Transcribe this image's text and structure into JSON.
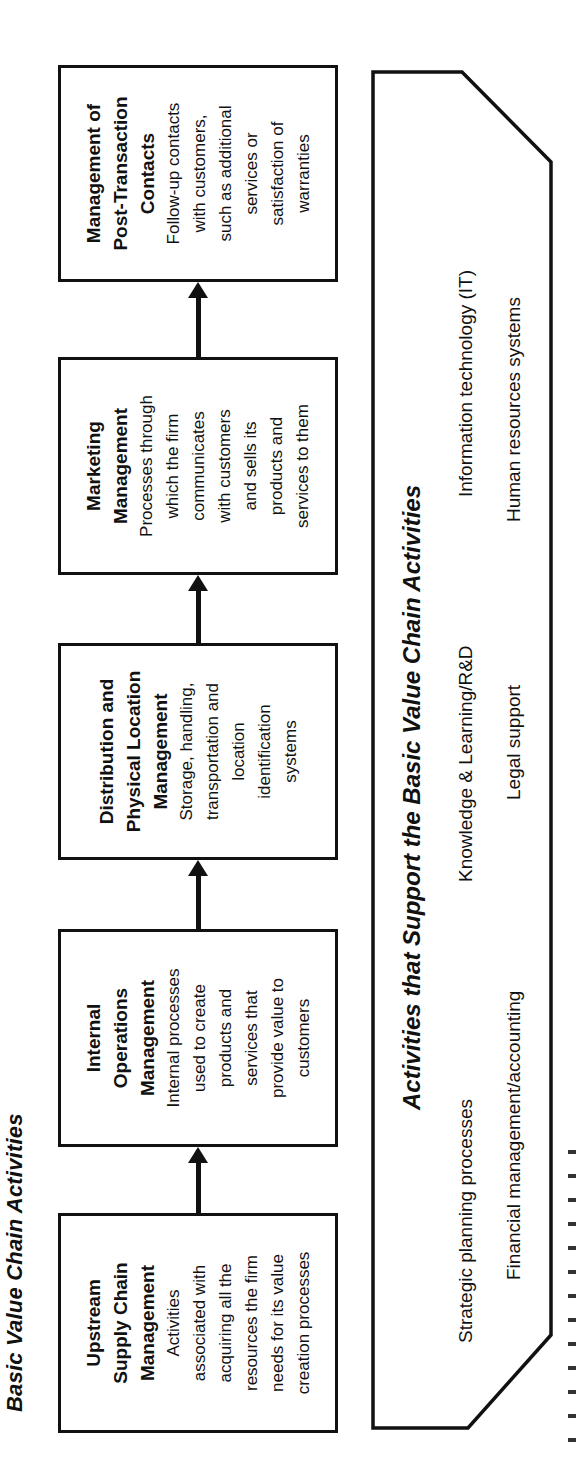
{
  "title": "Basic Value Chain Activities",
  "basic_activities": [
    {
      "title": "Upstream Supply Chain Management",
      "title_lines": [
        "Upstream",
        "Supply Chain",
        "Management"
      ],
      "body_lines": [
        "Activities",
        "associated with",
        "acquiring all the",
        "resources the firm",
        "needs for its value",
        "creation processes"
      ]
    },
    {
      "title": "Internal Operations Management",
      "title_lines": [
        "Internal",
        "Operations",
        "Management"
      ],
      "body_lines": [
        "Internal processes",
        "used to create",
        "products and",
        "services that",
        "provide value to",
        "customers"
      ]
    },
    {
      "title": "Distribution and Physical Location Management",
      "title_lines": [
        "Distribution and",
        "Physical Location",
        "Management"
      ],
      "body_lines": [
        "Storage, handling,",
        "transportation and",
        "location",
        "identification",
        "systems"
      ]
    },
    {
      "title": "Marketing Management",
      "title_lines": [
        "Marketing",
        "Management"
      ],
      "body_lines": [
        "Processes through",
        "which the firm",
        "communicates",
        "with customers",
        "and sells its",
        "products and",
        "services to them"
      ]
    },
    {
      "title": "Management of Post-Transaction Contacts",
      "title_lines": [
        "Management of",
        "Post-Transaction",
        "Contacts"
      ],
      "body_lines": [
        "Follow-up contacts",
        "with customers,",
        "such as additional",
        "services or",
        "satisfaction of",
        "warranties"
      ]
    }
  ],
  "support": {
    "header": "Activities that Support the Basic Value Chain Activities",
    "row1": [
      "Strategic planning processes",
      "Knowledge & Learning/R&D",
      "Information technology (IT)"
    ],
    "row2": [
      "Financial management/accounting",
      "Legal support",
      "Human resources systems"
    ]
  },
  "colors": {
    "line": "#111111",
    "background": "#ffffff"
  }
}
